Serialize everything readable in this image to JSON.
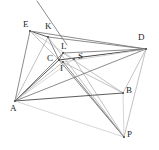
{
  "figure": {
    "type": "line-diagram",
    "width": 159,
    "height": 150,
    "background": "#ffffff"
  },
  "colors": {
    "dark_line": "#4a4a4a",
    "mid_line": "#6e6e6e",
    "light_line": "#a8a8a8",
    "faint_line": "#c4c4c4",
    "label_text": "#1d1d1d"
  },
  "points": [
    {
      "id": "E",
      "label": "E",
      "x": 30,
      "y": 31,
      "lx": 23,
      "ly": 20
    },
    {
      "id": "K",
      "label": "K",
      "x": 48,
      "y": 37,
      "lx": 45,
      "ly": 22
    },
    {
      "id": "D",
      "label": "D",
      "x": 146,
      "y": 49,
      "lx": 138,
      "ly": 33
    },
    {
      "id": "L",
      "label": "L",
      "x": 63,
      "y": 53,
      "lx": 61,
      "ly": 42
    },
    {
      "id": "C",
      "label": "C",
      "x": 59,
      "y": 60,
      "lx": 47,
      "ly": 54
    },
    {
      "id": "S",
      "label": "S",
      "x": 74,
      "y": 59,
      "lx": 78,
      "ly": 52
    },
    {
      "id": "I",
      "label": "I",
      "x": 63,
      "y": 62,
      "lx": 60,
      "ly": 64
    },
    {
      "id": "B",
      "label": "B",
      "x": 123,
      "y": 93,
      "lx": 126,
      "ly": 86
    },
    {
      "id": "A",
      "label": "A",
      "x": 15,
      "y": 101,
      "lx": 10,
      "ly": 104
    },
    {
      "id": "P",
      "label": "P",
      "x": 124,
      "y": 137,
      "lx": 127,
      "ly": 130
    }
  ],
  "segments": [
    {
      "name": "ray-through-K-extended",
      "from": [
        37,
        1
      ],
      "to": [
        67,
        45
      ],
      "shade": "mid_line",
      "width": 0.8
    },
    {
      "name": "E-to-A",
      "from": [
        30,
        31
      ],
      "to": [
        15,
        101
      ],
      "shade": "mid_line",
      "width": 0.8
    },
    {
      "name": "E-to-K",
      "from": [
        30,
        31
      ],
      "to": [
        48,
        37
      ],
      "shade": "dark_line",
      "width": 0.9
    },
    {
      "name": "E-to-D",
      "from": [
        30,
        31
      ],
      "to": [
        146,
        49
      ],
      "shade": "mid_line",
      "width": 0.8
    },
    {
      "name": "E-to-C",
      "from": [
        30,
        31
      ],
      "to": [
        59,
        60
      ],
      "shade": "light_line",
      "width": 0.7
    },
    {
      "name": "E-to-S",
      "from": [
        30,
        31
      ],
      "to": [
        74,
        59
      ],
      "shade": "faint_line",
      "width": 0.7
    },
    {
      "name": "K-to-C",
      "from": [
        48,
        37
      ],
      "to": [
        59,
        60
      ],
      "shade": "mid_line",
      "width": 0.8
    },
    {
      "name": "K-to-D",
      "from": [
        48,
        37
      ],
      "to": [
        146,
        49
      ],
      "shade": "mid_line",
      "width": 0.8
    },
    {
      "name": "K-to-A",
      "from": [
        48,
        37
      ],
      "to": [
        15,
        101
      ],
      "shade": "light_line",
      "width": 0.7
    },
    {
      "name": "L-to-C",
      "from": [
        63,
        53
      ],
      "to": [
        59,
        60
      ],
      "shade": "dark_line",
      "width": 0.8
    },
    {
      "name": "L-to-D",
      "from": [
        63,
        53
      ],
      "to": [
        146,
        49
      ],
      "shade": "mid_line",
      "width": 0.8
    },
    {
      "name": "C-to-D",
      "from": [
        59,
        60
      ],
      "to": [
        146,
        49
      ],
      "shade": "dark_line",
      "width": 1.1
    },
    {
      "name": "C-to-A",
      "from": [
        59,
        60
      ],
      "to": [
        15,
        101
      ],
      "shade": "dark_line",
      "width": 0.9
    },
    {
      "name": "C-to-B",
      "from": [
        59,
        60
      ],
      "to": [
        123,
        93
      ],
      "shade": "light_line",
      "width": 0.7
    },
    {
      "name": "C-to-P",
      "from": [
        59,
        60
      ],
      "to": [
        124,
        137
      ],
      "shade": "mid_line",
      "width": 0.8
    },
    {
      "name": "I-to-A",
      "from": [
        63,
        62
      ],
      "to": [
        15,
        101
      ],
      "shade": "light_line",
      "width": 0.7
    },
    {
      "name": "I-to-P",
      "from": [
        63,
        62
      ],
      "to": [
        124,
        137
      ],
      "shade": "mid_line",
      "width": 0.8
    },
    {
      "name": "S-to-A",
      "from": [
        74,
        59
      ],
      "to": [
        15,
        101
      ],
      "shade": "faint_line",
      "width": 0.7
    },
    {
      "name": "S-to-P",
      "from": [
        74,
        59
      ],
      "to": [
        124,
        137
      ],
      "shade": "light_line",
      "width": 0.7
    },
    {
      "name": "D-to-A",
      "from": [
        146,
        49
      ],
      "to": [
        15,
        101
      ],
      "shade": "mid_line",
      "width": 0.8
    },
    {
      "name": "D-to-B",
      "from": [
        146,
        49
      ],
      "to": [
        123,
        93
      ],
      "shade": "light_line",
      "width": 0.7
    },
    {
      "name": "D-to-P",
      "from": [
        146,
        49
      ],
      "to": [
        124,
        137
      ],
      "shade": "light_line",
      "width": 0.7
    },
    {
      "name": "D-to-I",
      "from": [
        146,
        49
      ],
      "to": [
        63,
        62
      ],
      "shade": "faint_line",
      "width": 0.7
    },
    {
      "name": "A-to-B",
      "from": [
        15,
        101
      ],
      "to": [
        123,
        93
      ],
      "shade": "dark_line",
      "width": 0.9
    },
    {
      "name": "A-to-P",
      "from": [
        15,
        101
      ],
      "to": [
        124,
        137
      ],
      "shade": "faint_line",
      "width": 0.7
    },
    {
      "name": "A-to-L",
      "from": [
        15,
        101
      ],
      "to": [
        63,
        53
      ],
      "shade": "mid_line",
      "width": 0.8
    },
    {
      "name": "B-to-P",
      "from": [
        123,
        93
      ],
      "to": [
        124,
        137
      ],
      "shade": "faint_line",
      "width": 0.7
    },
    {
      "name": "B-to-L",
      "from": [
        123,
        93
      ],
      "to": [
        63,
        53
      ],
      "shade": "light_line",
      "width": 0.7
    },
    {
      "name": "K-to-P",
      "from": [
        48,
        37
      ],
      "to": [
        124,
        137
      ],
      "shade": "light_line",
      "width": 0.7
    }
  ]
}
